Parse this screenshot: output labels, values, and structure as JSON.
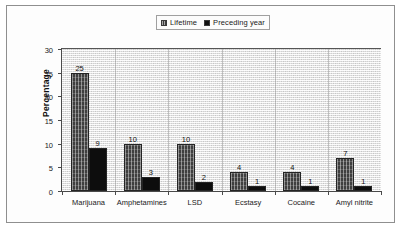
{
  "chart_data": {
    "type": "bar",
    "title": "",
    "xlabel": "",
    "ylabel": "Percentage",
    "ylim": [
      0,
      30
    ],
    "yticks": [
      0,
      5,
      10,
      15,
      20,
      25,
      30
    ],
    "ytick_labels": [
      "0",
      "5",
      "10",
      "15",
      "20",
      "25",
      "30"
    ],
    "grid": false,
    "legend_position": "top-center",
    "categories": [
      "Marijuana",
      "Amphetamines",
      "LSD",
      "Ecstasy",
      "Cocaine",
      "Amyl nitrite"
    ],
    "series": [
      {
        "name": "Lifetime",
        "color": "#3f3f3f",
        "values": [
          25,
          10,
          10,
          4,
          4,
          7
        ],
        "labels": [
          "25",
          "10",
          "10",
          "4",
          "4",
          "7"
        ]
      },
      {
        "name": "Preceding year",
        "color": "#0d0d0d",
        "values": [
          9,
          3,
          2,
          1,
          1,
          1
        ],
        "labels": [
          "9",
          "3",
          "2",
          "1",
          "1",
          "1"
        ]
      }
    ]
  },
  "legend": {
    "entries": [
      {
        "label": "Lifetime",
        "swatch": "lifetime-swatch"
      },
      {
        "label": "Preceding year",
        "swatch": "preceding-year-swatch"
      }
    ]
  },
  "axes": {
    "y_title": "Percentage"
  },
  "colors": {
    "lifetime": "#3f3f3f",
    "preceding_year": "#0d0d0d",
    "axis": "#4a4a4a",
    "plot_background": "#e9e9e9",
    "page_border": "#8f8f8f"
  }
}
